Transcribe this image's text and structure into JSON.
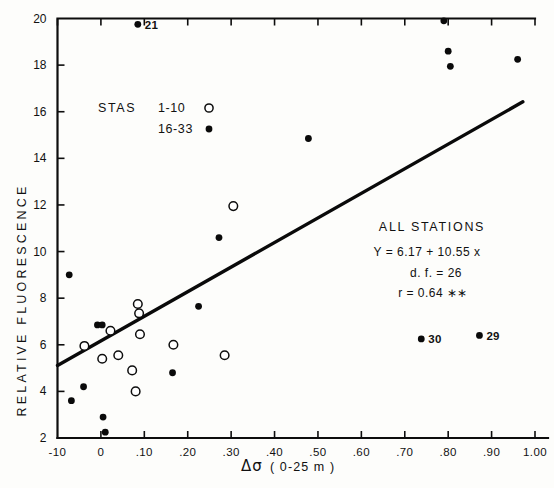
{
  "figure": {
    "background_color": "#fdfdfb",
    "ink_color": "#0d0d0d"
  },
  "axes": {
    "y_title": "RELATIVE  FLUORESCENCE",
    "x_title_symbol": "Δσ",
    "x_title_suffix": "( 0-25 m )",
    "x_tick_labels": [
      "-10",
      "0",
      ".10",
      ".20",
      ".30",
      ".40",
      ".50",
      ".60",
      ".70",
      ".80",
      ".90",
      "1.00"
    ],
    "y_tick_labels": [
      "2",
      "4",
      "6",
      "8",
      "10",
      "12",
      "14",
      "16",
      "18",
      "20"
    ]
  },
  "legend": {
    "title": "STAS",
    "entries": [
      {
        "range": "1-10",
        "marker": "open-circle"
      },
      {
        "range": "16-33",
        "marker": "filled-circle"
      }
    ]
  },
  "stats": {
    "heading": "ALL   STATIONS",
    "equation": "Y = 6.17 + 10.55 x",
    "degrees_freedom": "d. f. = 26",
    "correlation": "r  = 0.64 ∗∗"
  },
  "point_labels": [
    {
      "text": "21",
      "x": 0.085,
      "y": 19.75
    },
    {
      "text": "30",
      "x": 0.738,
      "y": 6.25
    },
    {
      "text": "29",
      "x": 0.872,
      "y": 6.4
    }
  ],
  "chart_data": {
    "type": "scatter",
    "title": "",
    "xlabel": "Δσ ( 0-25 m )",
    "ylabel": "RELATIVE FLUORESCENCE",
    "xlim": [
      -0.1,
      1.0
    ],
    "ylim": [
      2,
      20
    ],
    "xticks": [
      -0.1,
      0.0,
      0.1,
      0.2,
      0.3,
      0.4,
      0.5,
      0.6,
      0.7,
      0.8,
      0.9,
      1.0
    ],
    "yticks": [
      2,
      4,
      6,
      8,
      10,
      12,
      14,
      16,
      18,
      20
    ],
    "grid": false,
    "legend_position": "upper-left",
    "series": [
      {
        "name": "STAS 16-33",
        "marker": "filled-circle",
        "points": [
          {
            "x": -0.073,
            "y": 9.0
          },
          {
            "x": -0.068,
            "y": 3.6
          },
          {
            "x": -0.04,
            "y": 4.2
          },
          {
            "x": -0.008,
            "y": 6.85
          },
          {
            "x": 0.003,
            "y": 6.85
          },
          {
            "x": 0.005,
            "y": 2.9
          },
          {
            "x": 0.01,
            "y": 2.25
          },
          {
            "x": 0.085,
            "y": 19.75
          },
          {
            "x": 0.165,
            "y": 4.8
          },
          {
            "x": 0.225,
            "y": 7.65
          },
          {
            "x": 0.272,
            "y": 10.6
          },
          {
            "x": 0.478,
            "y": 14.85
          },
          {
            "x": 0.738,
            "y": 6.25
          },
          {
            "x": 0.79,
            "y": 19.9
          },
          {
            "x": 0.8,
            "y": 18.6
          },
          {
            "x": 0.805,
            "y": 17.95
          },
          {
            "x": 0.872,
            "y": 6.4
          },
          {
            "x": 0.96,
            "y": 18.25
          }
        ]
      },
      {
        "name": "STAS 1-10",
        "marker": "open-circle",
        "points": [
          {
            "x": -0.038,
            "y": 5.95
          },
          {
            "x": 0.003,
            "y": 5.4
          },
          {
            "x": 0.022,
            "y": 6.6
          },
          {
            "x": 0.04,
            "y": 5.55
          },
          {
            "x": 0.072,
            "y": 4.9
          },
          {
            "x": 0.08,
            "y": 4.0
          },
          {
            "x": 0.085,
            "y": 7.75
          },
          {
            "x": 0.088,
            "y": 7.35
          },
          {
            "x": 0.09,
            "y": 6.45
          },
          {
            "x": 0.167,
            "y": 6.0
          },
          {
            "x": 0.285,
            "y": 5.55
          },
          {
            "x": 0.305,
            "y": 11.95
          }
        ]
      }
    ],
    "regression": {
      "label": "ALL STATIONS",
      "equation": "Y = 6.17 + 10.55 x",
      "intercept": 6.17,
      "slope": 10.55,
      "df": 26,
      "r": 0.64,
      "significance": "**",
      "x_start": -0.1,
      "x_end": 0.972
    }
  }
}
